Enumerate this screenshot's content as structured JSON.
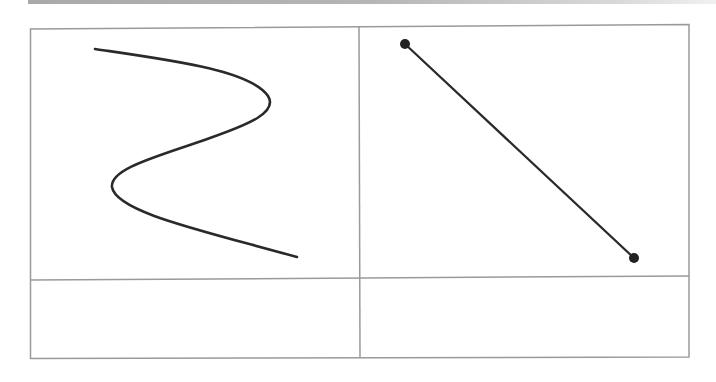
{
  "diagram": {
    "colors": {
      "grid": "#9a9a9a",
      "stroke": "#2a2a2a",
      "top_bar": "#a9a9a9",
      "background": "#ffffff"
    },
    "grid": {
      "rows": 2,
      "cols": 2,
      "cells": [
        {
          "id": "top-left",
          "content": "s-curve"
        },
        {
          "id": "top-right",
          "content": "line-segment-with-endpoints"
        },
        {
          "id": "bottom-left",
          "content": "empty"
        },
        {
          "id": "bottom-right",
          "content": "empty"
        }
      ]
    },
    "shapes": {
      "s_curve": {
        "start": [
          95,
          49
        ],
        "right_turn": [
          270,
          104
        ],
        "left_turn": [
          113,
          185
        ],
        "end": [
          297,
          257
        ]
      },
      "line_segment": {
        "start": [
          405,
          44
        ],
        "end": [
          634,
          258
        ],
        "endpoint_markers": "filled-circle"
      }
    }
  }
}
